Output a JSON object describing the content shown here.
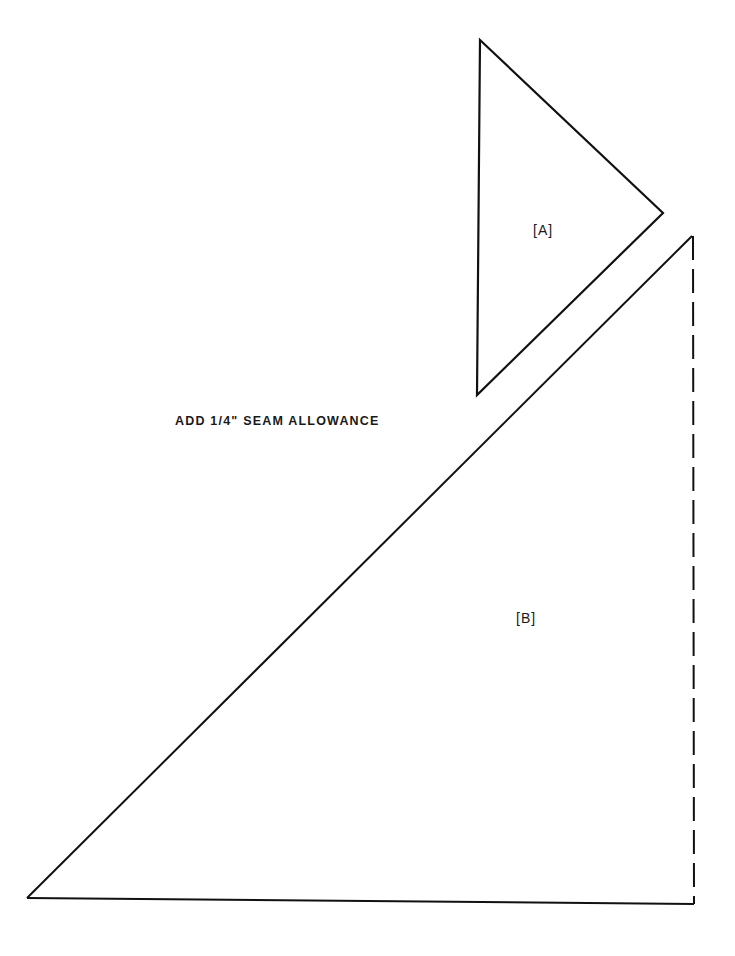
{
  "diagram": {
    "type": "sewing-pattern-template",
    "instruction": "ADD 1/4\" SEAM ALLOWANCE",
    "line_color": "#111111",
    "background": "#ffffff",
    "pieces": [
      {
        "id": "A",
        "label": "[A]",
        "shape": "triangle",
        "vertices": [
          [
            480,
            40
          ],
          [
            663,
            213
          ],
          [
            477,
            395
          ]
        ],
        "edges": "solid"
      },
      {
        "id": "B",
        "label": "[B]",
        "shape": "right-triangle",
        "vertices": [
          [
            692,
            236
          ],
          [
            694,
            904
          ],
          [
            27,
            898
          ]
        ],
        "edges": "hypotenuse and base solid; right edge dashed (fold line)"
      }
    ]
  }
}
